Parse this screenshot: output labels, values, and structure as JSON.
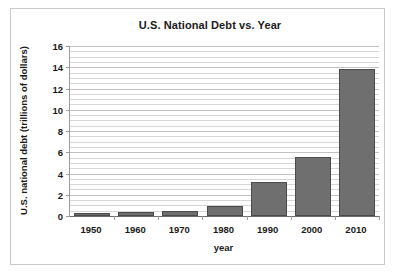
{
  "page": {
    "top_remnant": "' '"
  },
  "chart_data": {
    "type": "bar",
    "title": "U.S. National Debt vs. Year",
    "xlabel": "year",
    "ylabel": "U.S. national debt (trillions of dollars)",
    "categories": [
      "1950",
      "1960",
      "1970",
      "1980",
      "1990",
      "2000",
      "2010"
    ],
    "values": [
      0.2,
      0.4,
      0.5,
      0.9,
      3.2,
      5.6,
      13.8
    ],
    "series": [
      {
        "name": "U.S. national debt",
        "values": [
          0.2,
          0.4,
          0.5,
          0.9,
          3.2,
          5.6,
          13.8
        ]
      }
    ],
    "ylim": [
      0,
      16
    ],
    "ytick_labels": [
      "0",
      "2",
      "4",
      "6",
      "8",
      "10",
      "12",
      "14",
      "16"
    ],
    "ytick_values": [
      0,
      2,
      4,
      6,
      8,
      10,
      12,
      14,
      16
    ],
    "y_major_step": 2,
    "y_minor_step": 0.5,
    "grid": true,
    "grid_axis": "y",
    "legend": null,
    "legend_position": "none",
    "colors": {
      "bar_fill": "#6f6f6f",
      "bar_edge": "#4b4b4b",
      "gridline": "#d6d6d6",
      "axis": "#6d6d6d",
      "frame": "#c8c8c8",
      "background": "#ffffff",
      "text": "#1a1a1a"
    }
  }
}
